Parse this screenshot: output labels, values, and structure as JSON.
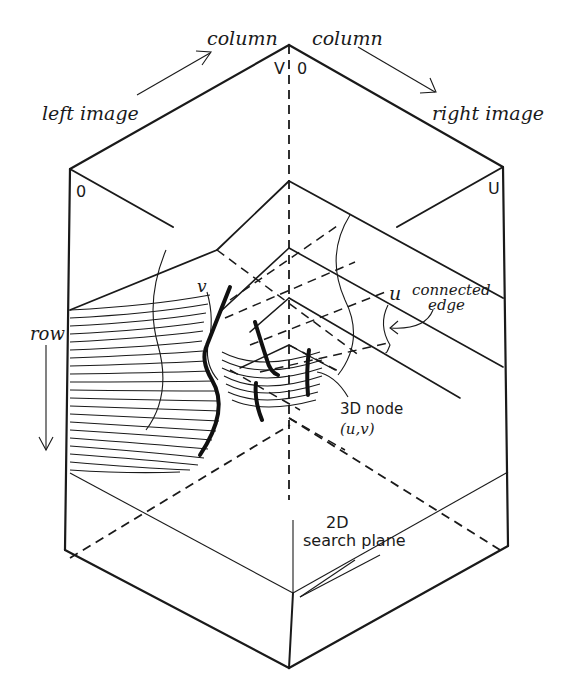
{
  "figure": {
    "colors": {
      "ink": "#1a1a1a",
      "background": "#ffffff"
    }
  },
  "labels": {
    "column_left": "column",
    "column_right": "column",
    "left_image": "left image",
    "right_image": "right image",
    "v_top": "V",
    "zero_top": "0",
    "zero_left": "0",
    "u_right": "U",
    "row": "row",
    "v_curve": "v",
    "u_curve": "u",
    "connected_edge_line1": "connected",
    "connected_edge_line2": "edge",
    "node_line1": "3D node",
    "node_line2": "(u,v)",
    "plane_line1": "2D",
    "plane_line2": "search plane"
  },
  "arrows": {
    "column_left_arrow": "arrow-up-right",
    "column_right_arrow": "arrow-down-right",
    "row_arrow": "arrow-down",
    "edge_pointer": "curved-arrow-left"
  }
}
